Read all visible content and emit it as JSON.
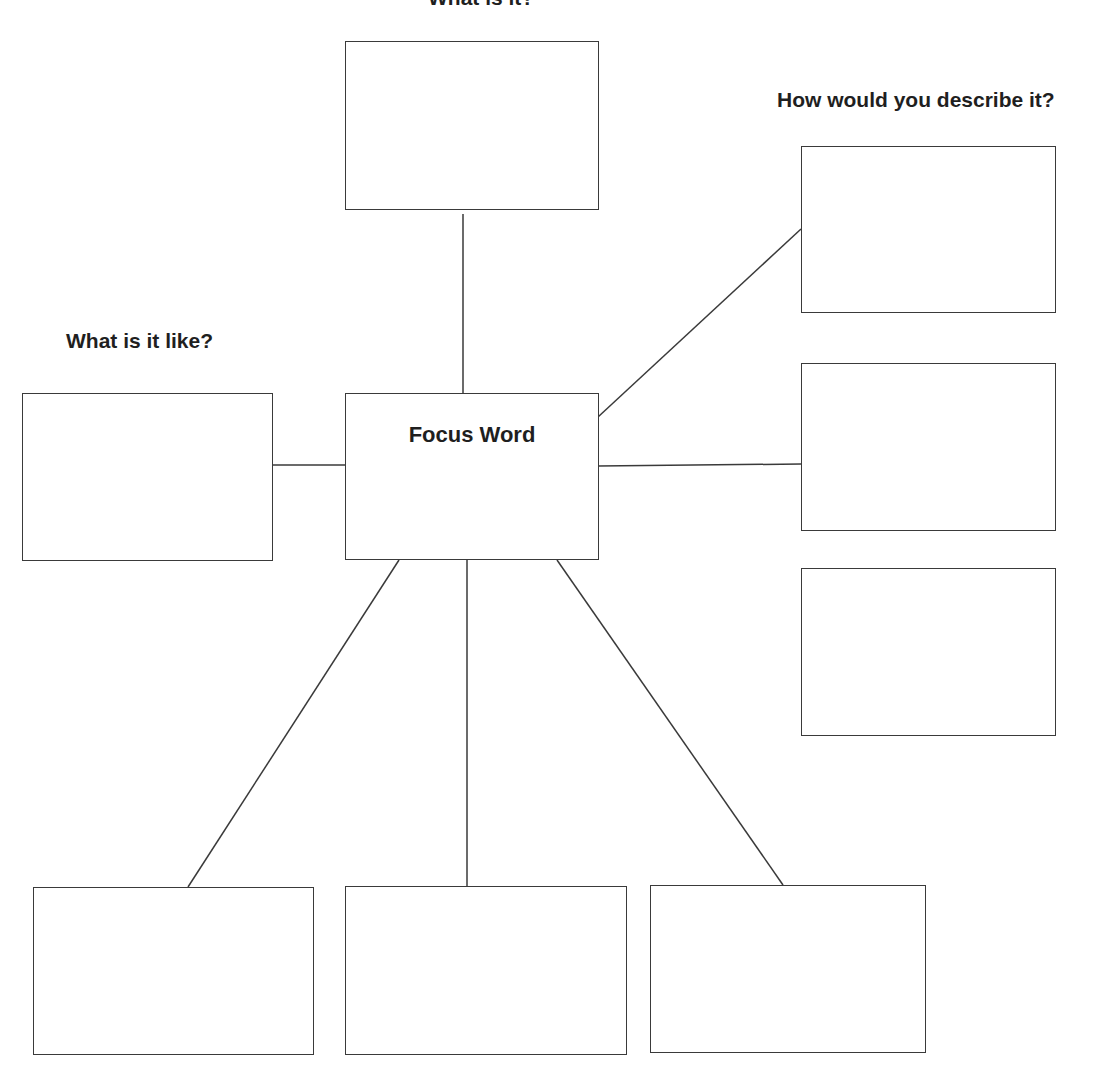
{
  "labels": {
    "top": "What is it?",
    "right": "How would you describe it?",
    "left": "What is it like?"
  },
  "center": {
    "title": "Focus Word"
  },
  "boxes": [
    {
      "id": "top",
      "value": ""
    },
    {
      "id": "left",
      "value": ""
    },
    {
      "id": "right-1",
      "value": ""
    },
    {
      "id": "right-2",
      "value": ""
    },
    {
      "id": "right-3",
      "value": ""
    },
    {
      "id": "bottom-1",
      "value": ""
    },
    {
      "id": "bottom-2",
      "value": ""
    },
    {
      "id": "bottom-3",
      "value": ""
    }
  ],
  "colors": {
    "stroke": "#3a3a3a",
    "background": "#ffffff"
  }
}
